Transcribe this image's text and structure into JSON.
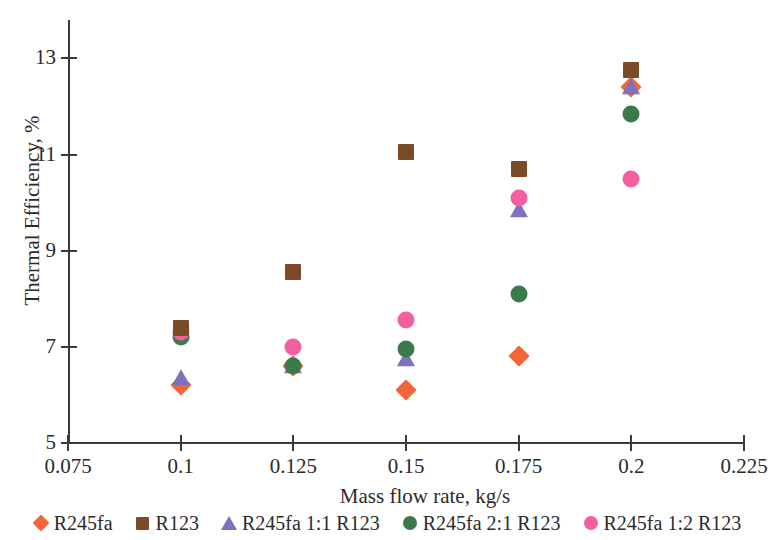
{
  "chart_data": {
    "type": "scatter",
    "title": "",
    "xlabel": "Mass flow rate, kg/s",
    "ylabel": "Thermal Efficiency, %",
    "xlim": [
      0.075,
      0.225
    ],
    "ylim": [
      5,
      13.8
    ],
    "xticks": [
      "0.075",
      "0.1",
      "0.125",
      "0.15",
      "0.175",
      "0.2",
      "0.225"
    ],
    "xtick_values": [
      0.075,
      0.1,
      0.125,
      0.15,
      0.175,
      0.2,
      0.225
    ],
    "yticks": [
      "5",
      "7",
      "9",
      "11",
      "13"
    ],
    "ytick_values": [
      5,
      7,
      9,
      11,
      13
    ],
    "grid": false,
    "legend_position": "bottom",
    "x": [
      0.1,
      0.125,
      0.15,
      0.175,
      0.2
    ],
    "series": [
      {
        "name": "R245fa",
        "marker": "diamond",
        "color": "#F4663A",
        "values": [
          6.2,
          6.6,
          6.1,
          6.8,
          12.4
        ]
      },
      {
        "name": "R123",
        "marker": "square",
        "color": "#7B4B2A",
        "values": [
          7.4,
          8.55,
          11.05,
          10.7,
          12.75
        ]
      },
      {
        "name": "R245fa 1:1 R123",
        "marker": "triangle",
        "color": "#8070C0",
        "values": [
          6.35,
          6.6,
          6.75,
          9.85,
          12.4
        ]
      },
      {
        "name": "R245fa 2:1 R123",
        "marker": "circle",
        "color": "#3B7A4A",
        "values": [
          7.2,
          6.6,
          6.95,
          8.1,
          11.85
        ]
      },
      {
        "name": "R245fa 1:2 R123",
        "marker": "circle",
        "color": "#F45FA0",
        "values": [
          7.3,
          7.0,
          7.55,
          10.1,
          10.5
        ]
      }
    ]
  }
}
